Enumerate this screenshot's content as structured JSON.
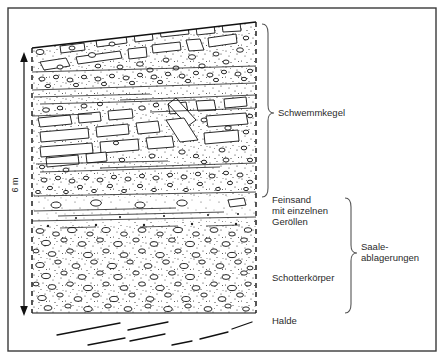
{
  "figure": {
    "type": "geological-cross-section",
    "title_visible": false,
    "background_color": "#ffffff",
    "ink_color": "#1a1a1a",
    "frame": {
      "x": 8,
      "y": 8,
      "width": 428,
      "height": 343,
      "stroke": "#3a3a3a"
    }
  },
  "scale": {
    "label": "6 m",
    "orientation": "vertical",
    "arrow_top_y": 55,
    "arrow_bottom_y": 313
  },
  "labels": {
    "schwemmkegel": "Schwemmkegel",
    "feinsand_line1": "Feinsand",
    "feinsand_line2": "mit einzelnen",
    "feinsand_line3": "Geröllen",
    "schotterkoerper": "Schotterkörper",
    "halde": "Halde",
    "saale_line1": "Saale-",
    "saale_line2": "ablagerungen"
  },
  "units": [
    {
      "id": "schwemmkegel",
      "label": "Schwemmkegel",
      "description": "alluvial fan gravels with angular elongated clasts in stippled sand matrix",
      "top_y": 22,
      "bottom_y": 197,
      "brace_side": "right"
    },
    {
      "id": "feinsand",
      "label": "Feinsand mit einzelnen Geröllen",
      "description": "fine sand with isolated pebbles, sparse stipple",
      "top_y": 197,
      "bottom_y": 222,
      "brace_side": "right"
    },
    {
      "id": "schotterkoerper",
      "label": "Schotterkörper",
      "description": "gravel body, dense rounded pebbles",
      "top_y": 222,
      "bottom_y": 313,
      "brace_side": "right"
    },
    {
      "id": "halde",
      "label": "Halde",
      "description": "talus / spoil slope shown as dashed diagonal lines below section",
      "top_y": 313,
      "bottom_y": 350,
      "brace_side": "none"
    }
  ],
  "groups": [
    {
      "id": "saale-ablagerungen",
      "label": "Saale-ablagerungen",
      "covers": [
        "feinsand",
        "schotterkoerper"
      ],
      "brace_top_y": 197,
      "brace_bottom_y": 313
    }
  ]
}
